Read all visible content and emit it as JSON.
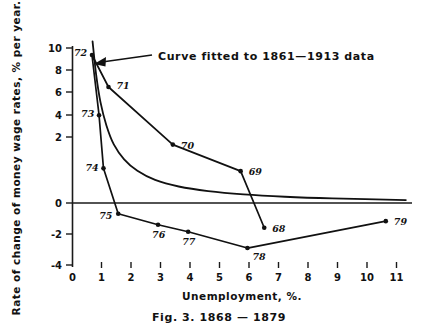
{
  "figure": {
    "caption": "Fig. 3.  1868 — 1879",
    "annotation": "Curve fitted to 1861—1913 data",
    "ink_color": "#111111",
    "background_color": "#ffffff"
  },
  "chart_data": {
    "type": "scatter",
    "title": "",
    "subtitle": "",
    "xlabel": "Unemployment, %.",
    "ylabel": "Rate of change of money wage rates, % per year.",
    "xlim": [
      0,
      11.4
    ],
    "ylim": [
      -4,
      10
    ],
    "xticks": [
      "0",
      "1",
      "2",
      "3",
      "4",
      "5",
      "6",
      "7",
      "8",
      "9",
      "10",
      "11"
    ],
    "xtick_values": [
      0,
      1,
      2,
      3,
      4,
      5,
      6,
      7,
      8,
      9,
      10,
      11
    ],
    "yticks": [
      "10",
      "8",
      "6",
      "4",
      "2",
      "0",
      "-2",
      "-4"
    ],
    "ytick_values": [
      10,
      8,
      6,
      4,
      2,
      0,
      -2,
      -4
    ],
    "grid": false,
    "legend": false,
    "zero_line": true,
    "annotations": [
      {
        "text": "Curve fitted to 1861—1913 data",
        "points_to": "fitted-curve",
        "x": 0.75,
        "y": 9.6
      }
    ],
    "series": [
      {
        "name": "Annual observations 1868–1879",
        "style": "line-with-markers-and-year-labels",
        "points": [
          {
            "label": "68",
            "x": 6.5,
            "y": -1.5,
            "label_dx": 8,
            "label_dy": 4
          },
          {
            "label": "69",
            "x": 5.7,
            "y": 1.93,
            "label_dx": 8,
            "label_dy": 4
          },
          {
            "label": "70",
            "x": 3.4,
            "y": 3.54,
            "label_dx": 8,
            "label_dy": 4
          },
          {
            "label": "71",
            "x": 1.22,
            "y": 7.03,
            "label_dx": 8,
            "label_dy": 2
          },
          {
            "label": "72",
            "x": 0.66,
            "y": 8.97,
            "label_dx": -18,
            "label_dy": 1
          },
          {
            "label": "73",
            "x": 0.9,
            "y": 5.32,
            "label_dx": -18,
            "label_dy": 2
          },
          {
            "label": "74",
            "x": 1.05,
            "y": 2.1,
            "label_dx": -18,
            "label_dy": 3
          },
          {
            "label": "75",
            "x": 1.55,
            "y": -0.65,
            "label_dx": -19,
            "label_dy": 5
          },
          {
            "label": "76",
            "x": 2.9,
            "y": -1.32,
            "label_dx": -6,
            "label_dy": 13
          },
          {
            "label": "77",
            "x": 3.92,
            "y": -1.74,
            "label_dx": -6,
            "label_dy": 13
          },
          {
            "label": "78",
            "x": 5.93,
            "y": -2.73,
            "label_dx": 5,
            "label_dy": 12
          },
          {
            "label": "79",
            "x": 10.62,
            "y": -1.1,
            "label_dx": 8,
            "label_dy": 4
          }
        ]
      },
      {
        "name": "Curve fitted to 1861–1913 data",
        "style": "smooth-curve-no-markers",
        "description": "Phillips curve fitted to 1861–1913 data; steep at low unemployment, asymptotic to slightly above zero.",
        "curve_points": [
          {
            "x": 0.68,
            "y": 9.8
          },
          {
            "x": 0.8,
            "y": 7.8
          },
          {
            "x": 0.95,
            "y": 6.1
          },
          {
            "x": 1.15,
            "y": 4.7
          },
          {
            "x": 1.4,
            "y": 3.55
          },
          {
            "x": 1.75,
            "y": 2.65
          },
          {
            "x": 2.2,
            "y": 1.95
          },
          {
            "x": 2.8,
            "y": 1.4
          },
          {
            "x": 3.6,
            "y": 1.0
          },
          {
            "x": 4.6,
            "y": 0.72
          },
          {
            "x": 5.8,
            "y": 0.52
          },
          {
            "x": 7.2,
            "y": 0.38
          },
          {
            "x": 8.8,
            "y": 0.28
          },
          {
            "x": 11.3,
            "y": 0.18
          }
        ]
      }
    ]
  }
}
